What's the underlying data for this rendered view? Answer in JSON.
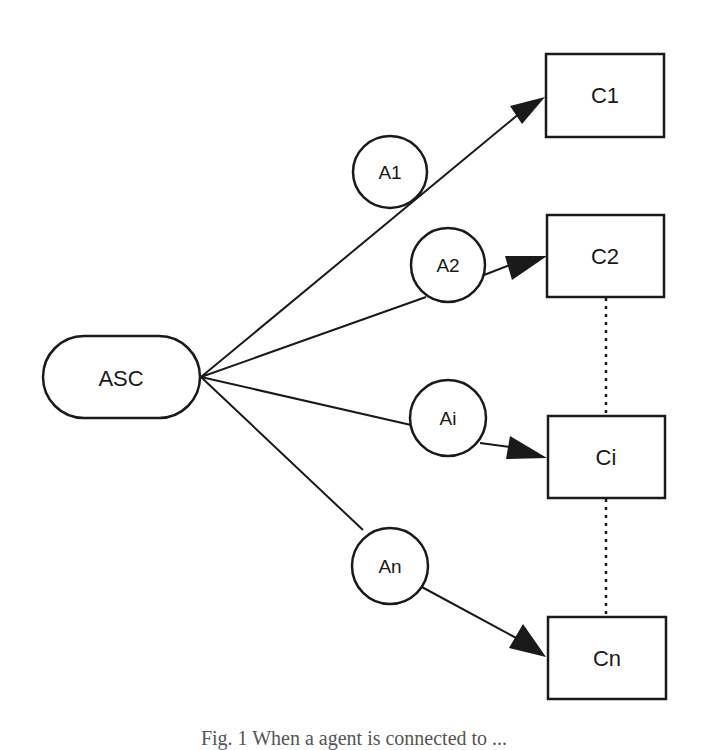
{
  "diagram": {
    "source": {
      "id": "ASC",
      "label": "ASC",
      "x": 43,
      "y": 336,
      "w": 157,
      "h": 82
    },
    "agents": [
      {
        "id": "A1",
        "label": "A1",
        "cx": 390,
        "cy": 172,
        "r": 37
      },
      {
        "id": "A2",
        "label": "A2",
        "cx": 448,
        "cy": 265,
        "r": 37
      },
      {
        "id": "Ai",
        "label": "Ai",
        "cx": 448,
        "cy": 418,
        "r": 38
      },
      {
        "id": "An",
        "label": "An",
        "cx": 390,
        "cy": 566,
        "r": 38
      }
    ],
    "targets": [
      {
        "id": "C1",
        "label": "C1",
        "x": 546,
        "y": 54,
        "w": 118,
        "h": 83
      },
      {
        "id": "C2",
        "label": "C2",
        "x": 547,
        "y": 215,
        "w": 117,
        "h": 82
      },
      {
        "id": "Ci",
        "label": "Ci",
        "x": 548,
        "y": 416,
        "w": 117,
        "h": 82
      },
      {
        "id": "Cn",
        "label": "Cn",
        "x": 548,
        "y": 617,
        "w": 118,
        "h": 82
      }
    ],
    "edges": [
      {
        "from": "ASC",
        "via": "A1",
        "to": "C1"
      },
      {
        "from": "ASC",
        "via": "A2",
        "to": "C2"
      },
      {
        "from": "ASC",
        "via": "Ai",
        "to": "Ci"
      },
      {
        "from": "ASC",
        "via": "An",
        "to": "Cn"
      }
    ],
    "dotted_connectors": [
      {
        "from": "C2",
        "to": "Ci"
      },
      {
        "from": "Ci",
        "to": "Cn"
      }
    ],
    "stroke_color": "#1a1a1a"
  },
  "caption": {
    "text": "Fig. 1  When a agent is connected to ..."
  }
}
